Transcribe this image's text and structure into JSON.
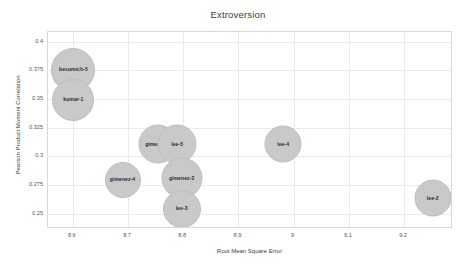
{
  "chart_data": {
    "type": "scatter",
    "title": "Extroversion",
    "xlabel": "Root Mean Square Error",
    "ylabel": "Pearson Product Moment Correlation",
    "xlim": [
      8.555,
      9.285
    ],
    "ylim": [
      0.2385,
      0.4085
    ],
    "xticks": [
      "8.6",
      "8.7",
      "8.8",
      "8.9",
      "9",
      "9.1",
      "9.2"
    ],
    "xtick_values": [
      8.6,
      8.7,
      8.8,
      8.9,
      9.0,
      9.1,
      9.2
    ],
    "yticks": [
      "0.4",
      "0.375",
      "0.35",
      "0.325",
      "0.3",
      "0.275",
      "0.25"
    ],
    "ytick_values": [
      0.4,
      0.375,
      0.35,
      0.325,
      0.3,
      0.275,
      0.25
    ],
    "grid": true,
    "legend": "none",
    "bubble_color": "#c9c9c9",
    "bubble_border_color": "#bdbdbd",
    "points": [
      {
        "label": "besumich-5",
        "x": 8.601,
        "y": 0.3755,
        "size": 44
      },
      {
        "label": "kumar-1",
        "x": 8.601,
        "y": 0.3495,
        "size": 42
      },
      {
        "label": "gimenez-1",
        "x": 8.754,
        "y": 0.3105,
        "size": 39
      },
      {
        "label": "lee-5",
        "x": 8.789,
        "y": 0.3105,
        "size": 39
      },
      {
        "label": "gimenez-4",
        "x": 8.69,
        "y": 0.2795,
        "size": 36
      },
      {
        "label": "gimenez-2",
        "x": 8.797,
        "y": 0.2815,
        "size": 41
      },
      {
        "label": "lee-3",
        "x": 8.797,
        "y": 0.2545,
        "size": 38
      },
      {
        "label": "lee-4",
        "x": 8.981,
        "y": 0.3105,
        "size": 37
      },
      {
        "label": "lee-2",
        "x": 9.252,
        "y": 0.264,
        "size": 37
      }
    ]
  }
}
